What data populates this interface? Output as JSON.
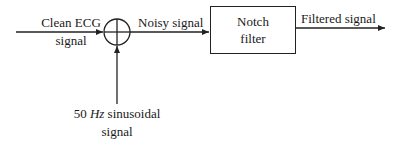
{
  "diagram": {
    "type": "block-diagram",
    "nodes": {
      "input": {
        "label_line1": "Clean ECG",
        "label_line2": "signal"
      },
      "summer": {
        "symbol": "summing-junction"
      },
      "noise": {
        "label_prefix": "50 ",
        "label_unit": "Hz",
        "label_suffix": " sinusoidal",
        "label_line2": "signal"
      },
      "filter": {
        "label_line1": "Notch",
        "label_line2": "filter"
      }
    },
    "edges": {
      "noisy": {
        "label": "Noisy signal"
      },
      "output": {
        "label": "Filtered signal"
      }
    },
    "colors": {
      "stroke": "#222222",
      "text": "#1a1a1a",
      "background": "#ffffff"
    }
  }
}
